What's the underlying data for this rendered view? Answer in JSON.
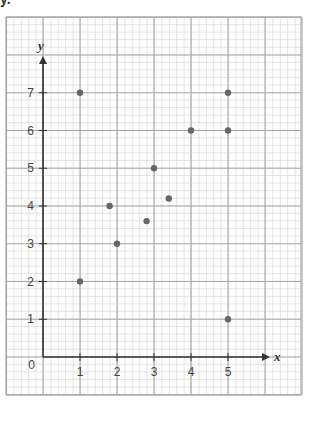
{
  "header": {
    "corner_label": "y."
  },
  "colors": {
    "minor_grid": "#d0d0d0",
    "major_grid": "#a8a8a8",
    "axis": "#333333",
    "point": "#666666",
    "text": "#444444"
  },
  "chart_data": {
    "type": "scatter",
    "title": "",
    "xlabel": "x",
    "ylabel": "y",
    "xlim": [
      -1,
      6
    ],
    "ylim": [
      -1,
      9
    ],
    "grid": true,
    "origin_label": "0",
    "x_ticks": [
      1,
      2,
      3,
      4,
      5
    ],
    "x_tick_labels": [
      "1",
      "2",
      "3",
      "4",
      "5"
    ],
    "y_ticks": [
      1,
      2,
      3,
      4,
      5,
      6,
      7
    ],
    "y_tick_labels": [
      "1",
      "2",
      "3",
      "4",
      "5",
      "6",
      "7"
    ],
    "points": [
      {
        "x": 1,
        "y": 7
      },
      {
        "x": 1,
        "y": 2
      },
      {
        "x": 1.8,
        "y": 4
      },
      {
        "x": 2,
        "y": 3
      },
      {
        "x": 2.8,
        "y": 3.6
      },
      {
        "x": 3,
        "y": 5
      },
      {
        "x": 3.4,
        "y": 4.2
      },
      {
        "x": 4,
        "y": 6
      },
      {
        "x": 5,
        "y": 7
      },
      {
        "x": 5,
        "y": 6
      },
      {
        "x": 5,
        "y": 1
      }
    ],
    "x": [
      1,
      1,
      1.8,
      2,
      2.8,
      3,
      3.4,
      4,
      5,
      5,
      5
    ],
    "y": [
      7,
      2,
      4,
      3,
      3.6,
      5,
      4.2,
      6,
      7,
      6,
      1
    ]
  }
}
